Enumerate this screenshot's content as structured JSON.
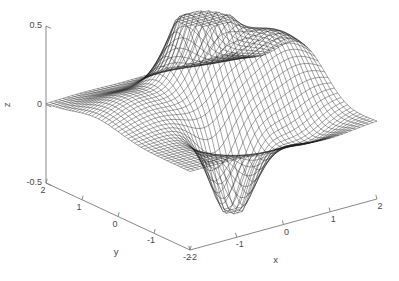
{
  "figure": {
    "background_color": "#ffffff",
    "mesh_color": "#1a1a1a",
    "axis_color": "#7a7a7a",
    "label_color": "#4a4a4a",
    "width": 399,
    "height": 281
  },
  "chart_data": {
    "type": "surface",
    "render": "wireframe-mesh",
    "title": "",
    "xlabel": "x",
    "ylabel": "y",
    "zlabel": "z",
    "xlim": [
      -2,
      2
    ],
    "ylim": [
      -2,
      2
    ],
    "zlim": [
      -0.5,
      0.5
    ],
    "xticks": [
      -2,
      -1,
      0,
      1,
      2
    ],
    "yticks": [
      -2,
      -1,
      0,
      1,
      2
    ],
    "zticks": [
      -0.5,
      0,
      0.5
    ],
    "xtick_labels": [
      "-2",
      "-1",
      "0",
      "1",
      "2"
    ],
    "ytick_labels": [
      "2",
      "1",
      "0",
      "-1",
      "-2"
    ],
    "ztick_labels": [
      "0.5",
      "0",
      "-0.5"
    ],
    "grid": false,
    "legend": false,
    "colorbar": false,
    "mesh_divisions": 44,
    "view": {
      "azimuth_deg": -37.5,
      "elevation_deg": 22,
      "projection": "orthographic"
    },
    "surface_function": "peaks-like: scaled two-gaussian-lobe function with positive ridge toward +x and a negative trough toward -y",
    "surface_terms": [
      {
        "amplitude": 0.62,
        "x0": 0.25,
        "y0": 0.72,
        "sx": 0.62,
        "sy": 0.62
      },
      {
        "amplitude": 0.4,
        "x0": 1.35,
        "y0": 0.1,
        "sx": 1.05,
        "sy": 0.95
      },
      {
        "amplitude": -0.55,
        "x0": -0.3,
        "y0": -0.95,
        "sx": 0.52,
        "sy": 0.52
      },
      {
        "amplitude": -0.18,
        "x0": 0.95,
        "y0": -1.1,
        "sx": 0.8,
        "sy": 0.7
      },
      {
        "amplitude": 0.14,
        "x0": -1.2,
        "y0": 0.6,
        "sx": 0.9,
        "sy": 0.9
      }
    ],
    "z_max_observed": 0.5,
    "z_min_observed": -0.5
  },
  "axes": {
    "x_axis_label": "x",
    "y_axis_label": "y",
    "z_axis_label": "z"
  }
}
